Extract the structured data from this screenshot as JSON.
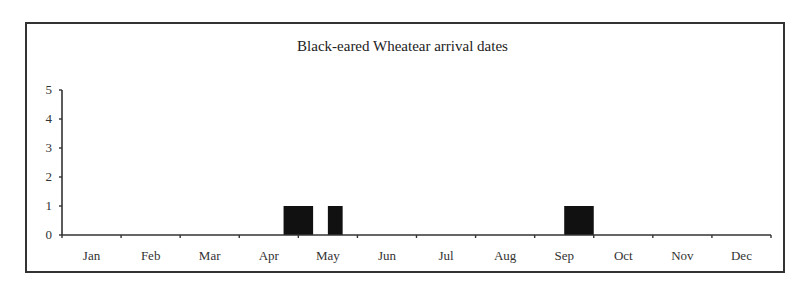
{
  "chart_data": {
    "type": "bar",
    "title": "Black-eared Wheatear arrival dates",
    "xlabel": "",
    "ylabel": "",
    "ylim": [
      0,
      5
    ],
    "yticks": [
      0,
      1,
      2,
      3,
      4,
      5
    ],
    "categories": [
      "Jan",
      "Feb",
      "Mar",
      "Apr",
      "May",
      "Jun",
      "Jul",
      "Aug",
      "Sep",
      "Oct",
      "Nov",
      "Dec"
    ],
    "grid": false,
    "legend": null,
    "bin_note": "Bars represent arrival counts per sub-month period",
    "bars": [
      {
        "period": "late Apr - early May",
        "start_month": 3.75,
        "end_month": 4.25,
        "value": 1
      },
      {
        "period": "mid May",
        "start_month": 4.5,
        "end_month": 4.75,
        "value": 1
      },
      {
        "period": "late Sep",
        "start_month": 8.5,
        "end_month": 9.0,
        "value": 1
      }
    ]
  },
  "style": {
    "bar_color": "#111111",
    "axis_color": "#333333"
  }
}
